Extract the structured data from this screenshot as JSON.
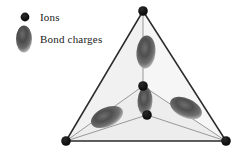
{
  "figure": {
    "type": "diagram",
    "background_color": "#ffffff",
    "width": 242,
    "height": 154
  },
  "legend": {
    "items": [
      {
        "key": "ions",
        "label": "Ions",
        "marker": "filled-circle",
        "marker_color": "#111111"
      },
      {
        "key": "bond_charges",
        "label": "Bond charges",
        "marker": "shaded-ellipse",
        "marker_color": "#555555"
      }
    ]
  },
  "structure": {
    "vertices": [
      {
        "name": "apex",
        "x": 143,
        "y": 11,
        "r": 4.6
      },
      {
        "name": "bottom-left",
        "x": 66,
        "y": 141,
        "r": 4.6
      },
      {
        "name": "bottom-right",
        "x": 226,
        "y": 141,
        "r": 4.6
      },
      {
        "name": "back-interior",
        "x": 143,
        "y": 86,
        "r": 4.6
      },
      {
        "name": "center",
        "x": 147,
        "y": 115,
        "r": 4.6
      }
    ],
    "outer_edges": [
      {
        "from": "apex",
        "to": "bottom-left"
      },
      {
        "from": "apex",
        "to": "bottom-right"
      },
      {
        "from": "bottom-left",
        "to": "bottom-right"
      }
    ],
    "inner_edges": [
      {
        "from": "apex",
        "to": "back-interior"
      },
      {
        "from": "back-interior",
        "to": "center"
      },
      {
        "from": "back-interior",
        "to": "bottom-left"
      },
      {
        "from": "back-interior",
        "to": "bottom-right"
      },
      {
        "from": "center",
        "to": "bottom-left"
      },
      {
        "from": "center",
        "to": "bottom-right"
      }
    ],
    "bond_charges": [
      {
        "name": "top-bond-charge",
        "cx": 146,
        "cy": 52,
        "rx": 9,
        "ry": 16,
        "rotation": 4
      },
      {
        "name": "middle-bond-charge",
        "cx": 145,
        "cy": 101,
        "rx": 7,
        "ry": 14,
        "rotation": 2
      },
      {
        "name": "left-bond-charge",
        "cx": 107,
        "cy": 117,
        "rx": 17,
        "ry": 9,
        "rotation": -24
      },
      {
        "name": "right-bond-charge",
        "cx": 186,
        "cy": 108,
        "rx": 17,
        "ry": 9,
        "rotation": 25
      }
    ],
    "colors": {
      "face_fill": "#f4f4f4",
      "outer_edge": "#2b2b2b",
      "inner_edge": "#8a8a8a",
      "ion": "#111111",
      "bond_charge_core": "#4a4a4a",
      "bond_charge_edge": "#9a9a9a"
    }
  }
}
